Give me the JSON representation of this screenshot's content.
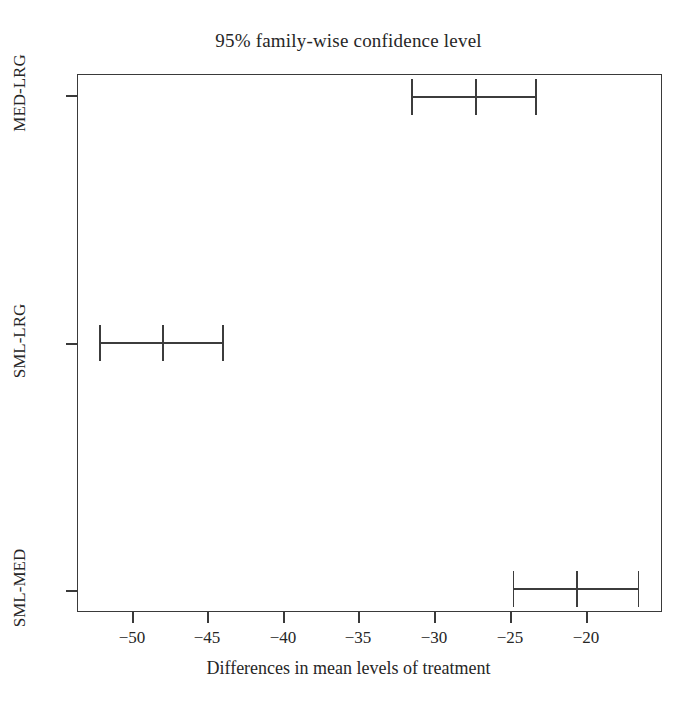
{
  "chart_data": {
    "type": "errorbar",
    "title": "95% family-wise confidence level",
    "xlabel": "Differences in mean levels of treatment",
    "ylabel": "",
    "xlim": [
      -53.7,
      -15.2
    ],
    "xticks": [
      -50,
      -45,
      -40,
      -35,
      -30,
      -25,
      -20
    ],
    "xticklabels": [
      "−50",
      "−45",
      "−40",
      "−35",
      "−30",
      "−25",
      "−20"
    ],
    "categories": [
      "SML-MED",
      "SML-LRG",
      "MED-LRG"
    ],
    "grid": false,
    "legend": null,
    "series": [
      {
        "name": "Tukey HSD confidence intervals",
        "points": [
          {
            "category": "MED-LRG",
            "estimate": -27.3,
            "lower": -31.5,
            "upper": -23.2
          },
          {
            "category": "SML-LRG",
            "estimate": -48.0,
            "lower": -52.2,
            "upper": -43.9
          },
          {
            "category": "SML-MED",
            "estimate": -20.6,
            "lower": -24.8,
            "upper": -16.4
          }
        ]
      }
    ]
  },
  "figure": {
    "title": "95% family-wise confidence level",
    "xaxis_title": "Differences in mean levels of treatment",
    "xticklabels": [
      "−50",
      "−45",
      "−40",
      "−35",
      "−30",
      "−25",
      "−20"
    ],
    "yticklabels": [
      "MED-LRG",
      "SML-LRG",
      "SML-MED"
    ]
  }
}
